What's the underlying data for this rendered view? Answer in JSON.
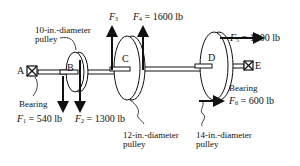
{
  "diagram": {
    "nodes": {
      "A": "A",
      "B": "B",
      "C": "C",
      "D": "D",
      "E": "E"
    },
    "labels": {
      "pulley_b_line1": "10-in.-diameter",
      "pulley_b_line2": "pulley",
      "pulley_c_line1": "12-in.-diameter",
      "pulley_c_line2": "pulley",
      "pulley_d_line1": "14-in.-diameter",
      "pulley_d_line2": "pulley",
      "bearing_a": "Bearing",
      "bearing_e": "Bearing"
    },
    "forces": {
      "f1": {
        "symbol": "F",
        "sub": "1",
        "value": "= 540 lb"
      },
      "f2": {
        "symbol": "F",
        "sub": "2",
        "value": "= 1300 lb"
      },
      "f3": {
        "symbol": "F",
        "sub": "3",
        "value": ""
      },
      "f4": {
        "symbol": "F",
        "sub": "4",
        "value": "= 1600 lb"
      },
      "f5": {
        "symbol": "F",
        "sub": "5",
        "value": "= 1000 lb"
      },
      "f6": {
        "symbol": "F",
        "sub": "6",
        "value": "= 600 lb"
      }
    },
    "colors": {
      "ink": "#111111",
      "background": "#ffffff"
    }
  }
}
